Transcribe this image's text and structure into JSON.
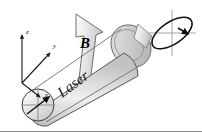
{
  "figure": {
    "background_color": "#ffffff",
    "width": 202,
    "height": 134
  },
  "axes": {
    "name": "coordinate-axes",
    "origin": {
      "x": 22,
      "y": 83
    },
    "items": [
      {
        "id": "z",
        "label": "z",
        "label_x": 26,
        "label_y": 34,
        "tip_x": 22,
        "tip_y": 33,
        "description": "vertical axis pointing up"
      },
      {
        "id": "y",
        "label": "y",
        "label_x": 54,
        "label_y": 47,
        "tip_x": 52,
        "tip_y": 52,
        "description": "diagonal axis pointing up-right"
      },
      {
        "id": "x",
        "label": "x",
        "label_x": 46,
        "label_y": 96,
        "tip_x": 41,
        "tip_y": 96,
        "description": "diagonal axis pointing down-right"
      }
    ]
  },
  "beam": {
    "name": "laser-beam-cylinder",
    "label": "Laser",
    "label_rotation_deg": -36,
    "fill_light": "#f2f2f2",
    "fill_mid": "#d8d8d8",
    "fill_dark": "#bdbdbd",
    "stroke": "#4a4a4a",
    "direction": "from lower-left to upper-right"
  },
  "field_arrow": {
    "name": "magnetic-field-arrow",
    "label": "B",
    "direction": "up and slightly left",
    "fill_light": "#f5f5f5",
    "fill_dark": "#cfcfcf",
    "stroke": "#5a5a5a"
  },
  "front_face": {
    "name": "beam-front-face",
    "description": "circular end face of beam with crosshair and polarization vector arrow",
    "center_x": 38,
    "center_y": 105,
    "radius": 16,
    "crosshair": true,
    "vector_angle_deg": -42
  },
  "polarization_ellipse": {
    "name": "polarization-ellipse",
    "description": "tilted ellipse with crosshair axes and rotation arrowhead indicating circular polarization",
    "center_x": 172,
    "center_y": 33,
    "rx": 23,
    "ry": 11,
    "tilt_deg": -34,
    "stroke": "#111111",
    "crosshair_color": "#8d8d8d",
    "arrow_position": "right"
  },
  "rear_face": {
    "name": "beam-rear-face",
    "description": "rounded rear end cap of the beam cylinder",
    "center_x": 131,
    "center_y": 46
  },
  "bottom_rule": {
    "name": "bottom-divider",
    "color": "#8a8a8a"
  }
}
